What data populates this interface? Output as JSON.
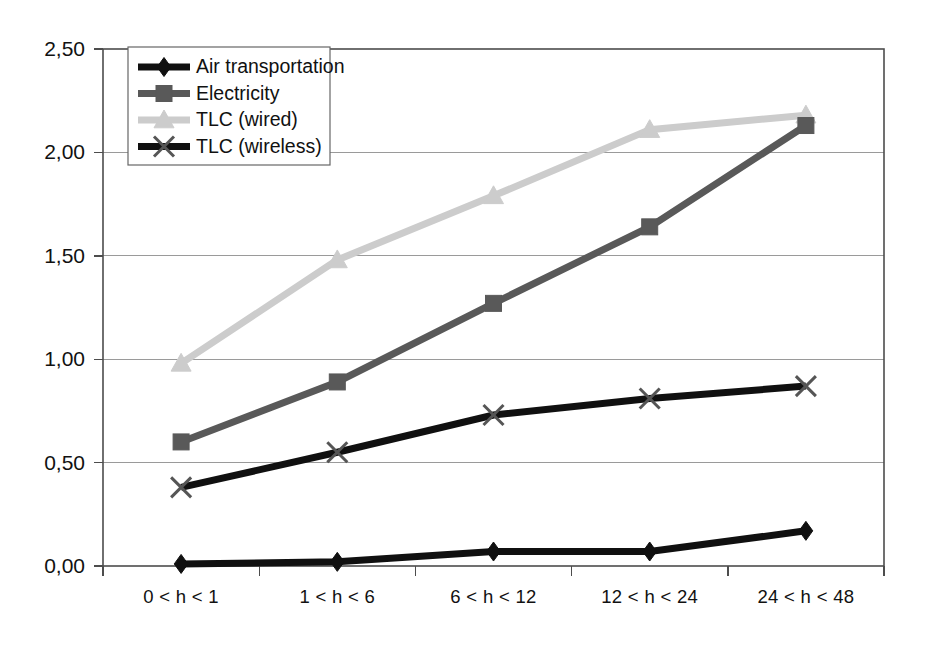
{
  "chart_data": {
    "type": "line",
    "title": "",
    "subtitle": "",
    "xlabel": "",
    "ylabel": "",
    "categories": [
      "0 < h < 1",
      "1 < h < 6",
      "6 < h < 12",
      "12 < h < 24",
      "24 < h < 48"
    ],
    "ylim": [
      0.0,
      2.5
    ],
    "ytick_labels": [
      "0,00",
      "0,50",
      "1,00",
      "1,50",
      "2,00",
      "2,50"
    ],
    "ytick_values": [
      0.0,
      0.5,
      1.0,
      1.5,
      2.0,
      2.5
    ],
    "grid": "horizontal",
    "legend_position": "top-left-inside",
    "series": [
      {
        "name": "Air transportation",
        "color": "#101010",
        "marker": "diamond",
        "values": [
          0.01,
          0.02,
          0.07,
          0.07,
          0.17
        ]
      },
      {
        "name": "Electricity",
        "color": "#595959",
        "marker": "square",
        "values": [
          0.6,
          0.89,
          1.27,
          1.64,
          2.13
        ]
      },
      {
        "name": "TLC (wired)",
        "color": "#cccccc",
        "marker": "triangle",
        "values": [
          0.98,
          1.48,
          1.79,
          2.11,
          2.18
        ]
      },
      {
        "name": "TLC (wireless)",
        "color": "#101010",
        "marker": "cross",
        "values": [
          0.38,
          0.55,
          0.73,
          0.81,
          0.87
        ]
      }
    ]
  },
  "axes": {
    "y_tick_labels": [
      "2,50",
      "2,00",
      "1,50",
      "1,00",
      "0,50",
      "0,00"
    ],
    "x_tick_labels": [
      "0 < h < 1",
      "1 < h < 6",
      "6 < h < 12",
      "12 < h < 24",
      "24 < h < 48"
    ]
  },
  "legend": {
    "items": [
      {
        "label": "Air transportation",
        "color": "#101010",
        "marker": "diamond"
      },
      {
        "label": "Electricity",
        "color": "#595959",
        "marker": "square"
      },
      {
        "label": "TLC (wired)",
        "color": "#cccccc",
        "marker": "triangle"
      },
      {
        "label": "TLC (wireless)",
        "color": "#101010",
        "marker": "cross"
      }
    ]
  },
  "colors": {
    "background": "#ffffff",
    "grid": "#9a9a9a",
    "border": "#4d4d4d",
    "text": "#111111"
  }
}
